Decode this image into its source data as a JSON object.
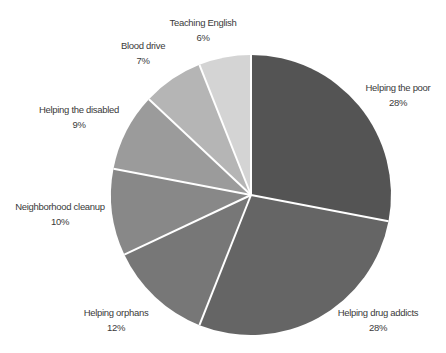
{
  "chart_data": {
    "type": "pie",
    "title": "",
    "start_angle_deg": 0,
    "direction": "clockwise",
    "center": [
      251,
      195
    ],
    "radius": 140,
    "slices": [
      {
        "label": "Helping the poor",
        "value": 28,
        "display": "28%",
        "color": "#545454",
        "label_pos": [
          398,
          88
        ]
      },
      {
        "label": "Helping drug addicts",
        "value": 28,
        "display": "28%",
        "color": "#656565",
        "label_pos": [
          378,
          313
        ]
      },
      {
        "label": "Helping orphans",
        "value": 12,
        "display": "12%",
        "color": "#777777",
        "label_pos": [
          116,
          313
        ]
      },
      {
        "label": "Neighborhood cleanup",
        "value": 10,
        "display": "10%",
        "color": "#888888",
        "label_pos": [
          60,
          207
        ]
      },
      {
        "label": "Helping the disabled",
        "value": 9,
        "display": "9%",
        "color": "#9b9b9b",
        "label_pos": [
          79,
          110
        ]
      },
      {
        "label": "Blood drive",
        "value": 7,
        "display": "7%",
        "color": "#b5b5b5",
        "label_pos": [
          143,
          46
        ]
      },
      {
        "label": "Teaching English",
        "value": 6,
        "display": "6%",
        "color": "#d4d4d4",
        "label_pos": [
          203,
          23
        ]
      }
    ],
    "legend": "none",
    "separator_color": "#ffffff"
  }
}
